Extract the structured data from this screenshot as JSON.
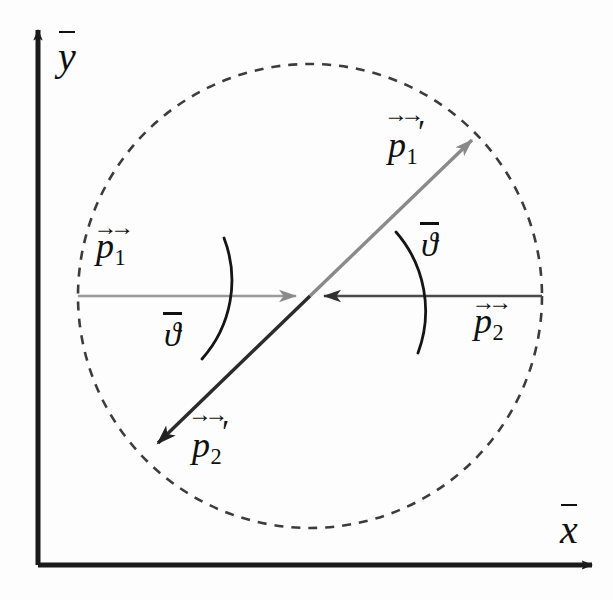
{
  "figure": {
    "background_color": "#fdfdfd",
    "width": 613,
    "height": 600
  },
  "colors": {
    "axis": "#1b1b1b",
    "incoming_p1": "#8a8a8a",
    "incoming_p2": "#3a3a3a",
    "outgoing_p1_prime": "#8a8a8a",
    "outgoing_p2_prime": "#2b2b2b",
    "circle_dashed": "#3c3c3c",
    "label_text": "#101010"
  },
  "axes": {
    "x_axis": {
      "label": "x",
      "overbar": true,
      "arrow": "right",
      "label_x": 560,
      "label_y": 503,
      "origin_x": 38,
      "origin_y": 565,
      "tip_x": 600,
      "tip_y": 565
    },
    "y_axis": {
      "label": "y",
      "overbar": true,
      "arrow": "up",
      "label_x": 58,
      "label_y": 30,
      "origin_x": 38,
      "origin_y": 565,
      "tip_x": 38,
      "tip_y": 22
    }
  },
  "circle": {
    "name": "momentum-magnitude-circle",
    "center_x": 310,
    "center_y": 296,
    "radius": 232,
    "style": "dashed",
    "dash_pattern": "9 8",
    "stroke_width": 2.6
  },
  "vectors": [
    {
      "id": "p1",
      "label_letter": "p",
      "subscript": "1",
      "prime": false,
      "overbar": true,
      "double_arrow": true,
      "role": "incoming particle 1 momentum",
      "color": "#8a8a8a",
      "from_x": 78,
      "from_y": 296,
      "to_x": 310,
      "to_y": 296,
      "arrowhead": "at-center-pointing-right",
      "label_x": 96,
      "label_y": 228
    },
    {
      "id": "p2",
      "label_letter": "p",
      "subscript": "2",
      "prime": false,
      "overbar": true,
      "double_arrow": true,
      "role": "incoming particle 2 momentum",
      "color": "#3a3a3a",
      "from_x": 542,
      "from_y": 296,
      "to_x": 310,
      "to_y": 296,
      "arrowhead": "at-center-pointing-left",
      "label_x": 474,
      "label_y": 303
    },
    {
      "id": "p1prime",
      "label_letter": "p",
      "subscript": "1",
      "prime": true,
      "overbar": true,
      "double_arrow": true,
      "role": "outgoing particle 1 momentum",
      "color": "#8a8a8a",
      "from_x": 310,
      "from_y": 296,
      "to_x": 478,
      "to_y": 134,
      "arrowhead": "at-tip-pointing-upper-right",
      "label_x": 388,
      "label_y": 115
    },
    {
      "id": "p2prime",
      "label_letter": "p",
      "subscript": "2",
      "prime": true,
      "overbar": true,
      "double_arrow": true,
      "role": "outgoing particle 2 momentum",
      "color": "#2b2b2b",
      "from_x": 310,
      "from_y": 296,
      "to_x": 151,
      "to_y": 450,
      "arrowhead": "at-tip-pointing-lower-left",
      "label_x": 192,
      "label_y": 415
    }
  ],
  "angles": [
    {
      "id": "theta-upper",
      "label": "ϑ",
      "overbar": true,
      "role": "scattering angle between +x axis and outgoing p1 prime",
      "value_degrees": 44,
      "label_x": 421,
      "label_y": 222,
      "arc_radius": 120
    },
    {
      "id": "theta-lower",
      "label": "ϑ",
      "overbar": true,
      "role": "scattering angle between -x axis and outgoing p2 prime",
      "value_degrees": 44,
      "label_x": 164,
      "label_y": 312,
      "arc_radius": 118
    }
  ]
}
